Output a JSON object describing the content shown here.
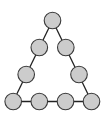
{
  "diagram": {
    "type": "triangle-of-nodes",
    "colors": {
      "node_fill": "#cccccc",
      "node_stroke": "#3a3a3a",
      "edge": "#222222",
      "background": "#ffffff"
    },
    "node_radius": 8.3,
    "nodes": [
      {
        "id": "n1",
        "x": 52.5,
        "y": 20.5
      },
      {
        "id": "n2",
        "x": 39.3,
        "y": 47.5
      },
      {
        "id": "n3",
        "x": 65.8,
        "y": 47.5
      },
      {
        "id": "n4",
        "x": 26.2,
        "y": 74.5
      },
      {
        "id": "n5",
        "x": 79.0,
        "y": 74.5
      },
      {
        "id": "n6",
        "x": 13.2,
        "y": 101.5
      },
      {
        "id": "n7",
        "x": 39.3,
        "y": 101.5
      },
      {
        "id": "n8",
        "x": 65.5,
        "y": 101.5
      },
      {
        "id": "n9",
        "x": 91.5,
        "y": 101.5
      }
    ],
    "edges": [
      [
        "n1",
        "n6"
      ],
      [
        "n1",
        "n9"
      ],
      [
        "n6",
        "n9"
      ]
    ]
  }
}
